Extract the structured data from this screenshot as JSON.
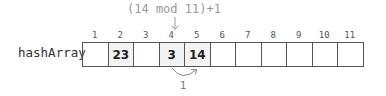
{
  "formula": "(14 mod 11)+1",
  "array_label": "hashArray",
  "indices": [
    "1",
    "2",
    "3",
    "4",
    "5",
    "6",
    "7",
    "8",
    "9",
    "10",
    "11"
  ],
  "cells": [
    {
      "value": "",
      "filled": false
    },
    {
      "value": "23",
      "filled": true
    },
    {
      "value": "",
      "filled": false
    },
    {
      "value": "3",
      "filled": true
    },
    {
      "value": "14",
      "filled": true
    },
    {
      "value": "",
      "filled": false
    },
    {
      "value": "",
      "filled": false
    },
    {
      "value": "",
      "filled": false
    },
    {
      "value": "",
      "filled": false
    },
    {
      "value": "",
      "filled": false
    },
    {
      "value": "",
      "filled": false
    }
  ],
  "probe_step_label": "1"
}
